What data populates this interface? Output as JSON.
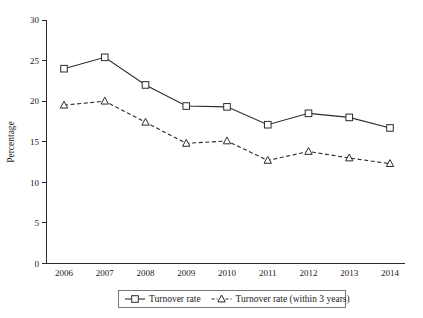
{
  "chart_data": {
    "type": "line",
    "title": "",
    "xlabel": "",
    "ylabel": "Percentage",
    "categories": [
      "2006",
      "2007",
      "2008",
      "2009",
      "2010",
      "2011",
      "2012",
      "2013",
      "2014"
    ],
    "x": [
      2006,
      2007,
      2008,
      2009,
      2010,
      2011,
      2012,
      2013,
      2014
    ],
    "ylim": [
      0,
      30
    ],
    "yticks": [
      0,
      5,
      10,
      15,
      20,
      25,
      30
    ],
    "ytick_labels": [
      "0",
      "5",
      "10",
      "15",
      "20",
      "25",
      "30"
    ],
    "grid": false,
    "legend_position": "below-axis-center",
    "series": [
      {
        "name": "Turnover rate",
        "marker": "open-square",
        "linestyle": "solid",
        "color": "#2b2b2b",
        "values": [
          24.0,
          25.4,
          22.0,
          19.4,
          19.3,
          17.1,
          18.5,
          18.0,
          16.7
        ]
      },
      {
        "name": "Turnover rate (within 3 years)",
        "marker": "open-triangle",
        "linestyle": "dashed",
        "color": "#2b2b2b",
        "values": [
          19.5,
          20.0,
          17.4,
          14.8,
          15.1,
          12.7,
          13.8,
          13.0,
          12.3
        ]
      }
    ]
  },
  "axes": {
    "y_title": "Percentage"
  },
  "legend": {
    "items": [
      {
        "label": "Turnover rate"
      },
      {
        "label": "Turnover rate (within 3 years)"
      }
    ]
  },
  "colors": {
    "ink": "#2b2b2b",
    "background": "#ffffff",
    "legend_border": "#777777"
  }
}
